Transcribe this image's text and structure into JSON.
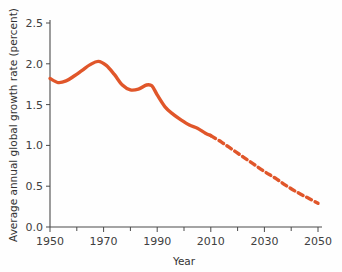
{
  "chart_data": {
    "type": "line",
    "title": "",
    "subtitle": "",
    "xlabel": "Year",
    "ylabel": "Average annual global growth rate (percent)",
    "xlim": [
      1950,
      2050
    ],
    "ylim": [
      0.0,
      2.5
    ],
    "grid": false,
    "legend_position": "none",
    "x_tick_labels": [
      "1950",
      "1970",
      "1990",
      "2010",
      "2030",
      "2050"
    ],
    "x_tick_values": [
      1950,
      1970,
      1990,
      2010,
      2030,
      2050
    ],
    "x_minor_tick_values": [
      1960,
      1980,
      2000,
      2020,
      2040
    ],
    "y_tick_labels": [
      "0.0",
      "0.5",
      "1.0",
      "1.5",
      "2.0",
      "2.5"
    ],
    "y_tick_values": [
      0.0,
      0.5,
      1.0,
      1.5,
      2.0,
      2.5
    ],
    "line_color": "#e0562a",
    "line_highlight_color": "#f0a020",
    "axis_color": "#4a4a4a",
    "background_color": "#fefefe",
    "series": [
      {
        "name": "Observed average annual global growth rate",
        "style": "solid",
        "x": [
          1950,
          1953,
          1956,
          1959,
          1962,
          1965,
          1968,
          1971,
          1974,
          1977,
          1980,
          1983,
          1986,
          1988,
          1990,
          1993,
          1996,
          1999,
          2002,
          2005,
          2008,
          2010
        ],
        "values": [
          1.82,
          1.77,
          1.79,
          1.85,
          1.92,
          1.99,
          2.03,
          1.98,
          1.87,
          1.74,
          1.68,
          1.69,
          1.74,
          1.73,
          1.62,
          1.47,
          1.38,
          1.31,
          1.25,
          1.21,
          1.15,
          1.12
        ]
      },
      {
        "name": "Projected average annual global growth rate",
        "style": "dashed",
        "x": [
          2010,
          2014,
          2018,
          2022,
          2026,
          2030,
          2034,
          2038,
          2042,
          2046,
          2050
        ],
        "values": [
          1.12,
          1.04,
          0.95,
          0.86,
          0.77,
          0.68,
          0.6,
          0.51,
          0.43,
          0.36,
          0.29
        ]
      }
    ]
  }
}
